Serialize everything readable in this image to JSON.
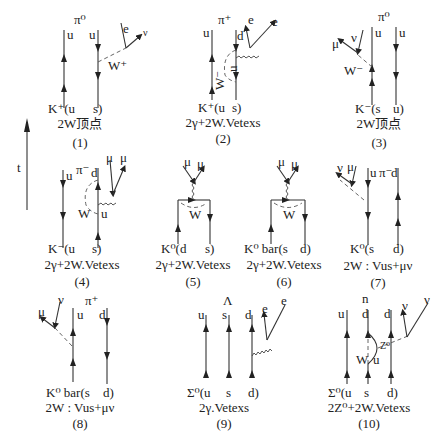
{
  "time_axis": {
    "label": "t"
  },
  "diagrams": [
    {
      "id": "(1)",
      "final": "π⁰",
      "top_quarks": [
        "u",
        "u"
      ],
      "initial": "K⁺(u",
      "initial_right": "s)",
      "leptons": [
        "e",
        "ν"
      ],
      "boson": "W⁺",
      "caption": "2W顶点",
      "number": "(1)"
    },
    {
      "id": "(2)",
      "final": "π⁺",
      "top_quarks": [
        "u",
        "d"
      ],
      "initial": "K⁺(u",
      "initial_right": "s)",
      "leptons": [
        "e",
        "e"
      ],
      "boson": "W⁻",
      "internal": "u",
      "caption": "2γ+2W.Vetexs",
      "number": "(2)"
    },
    {
      "id": "(3)",
      "final": "π⁰",
      "top_quarks": [
        "u",
        "u"
      ],
      "initial": "K⁻(s",
      "initial_right": "u)",
      "leptons": [
        "μ",
        "ν"
      ],
      "boson": "W⁻",
      "caption": "2W顶点",
      "number": "(3)"
    },
    {
      "id": "(4)",
      "final": "π⁻",
      "top_quarks": [
        "u",
        "d"
      ],
      "initial": "K⁻(u",
      "initial_right": "s)",
      "leptons": [
        "μ",
        "μ"
      ],
      "boson": "W",
      "internal": "u",
      "caption": "2γ+2W.Vetexs",
      "number": "(4)"
    },
    {
      "id": "(5)",
      "initial": "K⁰(d",
      "initial_right": "s)",
      "leptons": [
        "μ",
        "μ"
      ],
      "boson": "W",
      "caption": "2γ+2W.Vetexs",
      "number": "(5)"
    },
    {
      "id": "(6)",
      "initial": "K⁰ bar(s",
      "initial_right": "d)",
      "leptons": [
        "μ",
        "μ"
      ],
      "boson": "W",
      "caption": "2γ+2W.Vetexs",
      "number": "(6)"
    },
    {
      "id": "(7)",
      "final": "π⁻",
      "top_quarks": [
        "u",
        "d"
      ],
      "initial": "K⁰(s",
      "initial_right": "d)",
      "leptons": [
        "ν",
        "μ"
      ],
      "caption": "2W : Vus+μν",
      "number": "(7)"
    },
    {
      "id": "(8)",
      "final": "π⁺",
      "top_quarks": [
        "u",
        "d"
      ],
      "initial": "K⁰ bar(s",
      "initial_right": "d)",
      "leptons": [
        "μ",
        "ν"
      ],
      "caption": "2W : Vus+μν",
      "number": "(8)"
    },
    {
      "id": "(9)",
      "final": "Λ",
      "top_quarks": [
        "u",
        "s",
        "d"
      ],
      "initial": "Σ⁰(u",
      "initial_mid": "s",
      "initial_right": "d)",
      "leptons": [
        "e",
        "e"
      ],
      "caption": "2γ.Vetexs",
      "number": "(9)"
    },
    {
      "id": "(10)",
      "final": "n",
      "top_quarks": [
        "u",
        "d",
        "d"
      ],
      "initial": "Σ⁰(u",
      "initial_mid": "s",
      "initial_right": "d)",
      "leptons": [
        "ν",
        "ν"
      ],
      "boson": "W",
      "boson2": "Z⁰",
      "internal": "u",
      "caption": "2Z⁰+2W.Vetexs",
      "number": "(10)"
    }
  ]
}
